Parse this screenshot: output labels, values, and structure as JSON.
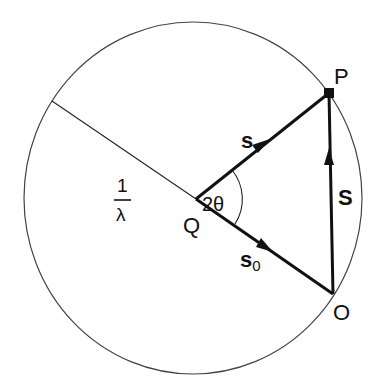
{
  "diagram": {
    "type": "ewald-sphere-construction",
    "circle": {
      "cx": 193,
      "cy": 198,
      "rx": 169,
      "ry": 176,
      "stroke": "#444444"
    },
    "points": {
      "Q": {
        "x": 196,
        "y": 199,
        "label": "Q"
      },
      "P": {
        "x": 329,
        "y": 93,
        "label": "P"
      },
      "O": {
        "x": 333,
        "y": 294,
        "label": "O"
      },
      "R": {
        "x": 52,
        "y": 101
      }
    },
    "labels": {
      "radius_numerator": "1",
      "radius_denominator": "λ",
      "angle": "2θ",
      "vector_s": "s",
      "vector_s0": "s",
      "vector_s0_sub": "0",
      "vector_S": "S"
    },
    "colors": {
      "line": "#111111",
      "circle": "#444444",
      "background": "#ffffff"
    }
  }
}
